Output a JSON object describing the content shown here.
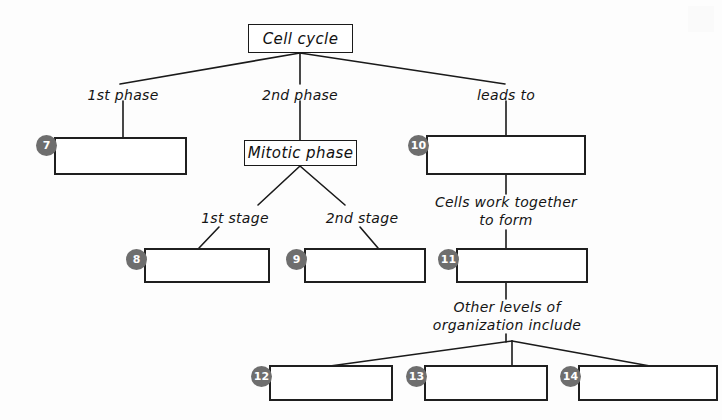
{
  "diagram": {
    "title_node": {
      "label": "Cell cycle"
    },
    "mitotic_node": {
      "label": "Mitotic phase"
    },
    "edge_labels": {
      "first_phase": "1st phase",
      "second_phase": "2nd phase",
      "leads_to": "leads to",
      "first_stage": "1st stage",
      "second_stage": "2nd stage",
      "cells_work_together": "Cells work together\nto form",
      "other_levels": "Other levels of\norganization include"
    },
    "markers": {
      "m7": "7",
      "m8": "8",
      "m9": "9",
      "m10": "10",
      "m11": "11",
      "m12": "12",
      "m13": "13",
      "m14": "14"
    },
    "blank_answers": {
      "b7": "",
      "b8": "",
      "b9": "",
      "b10": "",
      "b11": "",
      "b12": "",
      "b13": "",
      "b14": ""
    },
    "colors": {
      "marker_fill": "#6e6e6e",
      "marker_text": "#ffffff",
      "line": "#1a1a1a",
      "box_border": "#1f1f1f",
      "background": "#fdfdfd"
    }
  }
}
